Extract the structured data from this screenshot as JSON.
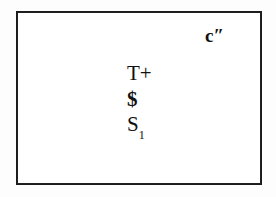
{
  "figure": {
    "type": "line-diagram",
    "background_color": "#fdfdfd",
    "box": {
      "name": "outer-rectangle",
      "stroke_color": "#1b1b1b",
      "fill_color": "#ffffff",
      "x": 16,
      "y": 11,
      "width": 246,
      "height": 174,
      "stroke_width": 2
    },
    "labels": {
      "corner": {
        "base": "c",
        "mark": "″",
        "full": "c″",
        "position": "top-right",
        "color": "#111111"
      },
      "stack": [
        {
          "name": "t-plus",
          "text": "T+",
          "color": "#111111",
          "weight": "normal"
        },
        {
          "name": "dollar",
          "text": "$",
          "color": "#111111",
          "weight": "bold"
        },
        {
          "name": "s-subscript-1",
          "base": "S",
          "subscript": "1",
          "full": "S₁",
          "color": "#111111",
          "weight": "normal"
        }
      ]
    }
  }
}
